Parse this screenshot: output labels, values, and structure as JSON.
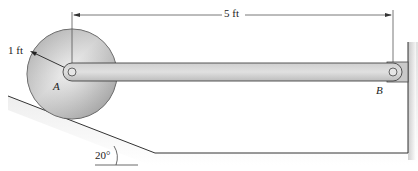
{
  "diagram": {
    "dimension_top": "5 ft",
    "radius_label": "1 ft",
    "point_a": "A",
    "point_b": "B",
    "incline_angle": "20°"
  },
  "colors": {
    "disk_light": "#e8e8e8",
    "disk_dark": "#9a9a9a",
    "bar_fill": "#d4d4d4",
    "line": "#333333"
  }
}
